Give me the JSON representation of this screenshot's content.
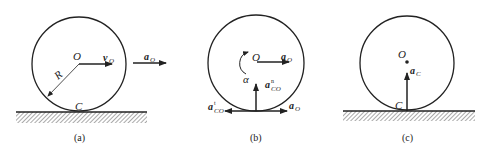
{
  "diagram": {
    "panels": [
      {
        "id": "a",
        "caption": "(a)",
        "center_label": "O",
        "contact_label": "C",
        "radius_label": "R",
        "velocity": {
          "base": "v",
          "sub": "O"
        },
        "acceleration": {
          "base": "a",
          "sub": "O"
        }
      },
      {
        "id": "b",
        "caption": "(b)",
        "center_label": "O",
        "angular_accel_label": "α",
        "center_accel": {
          "base": "a",
          "sub": "O"
        },
        "normal_accel": {
          "base": "a",
          "sub": "CO",
          "sup": "n"
        },
        "tangential_accel": {
          "base": "a",
          "sub": "CO",
          "sup": "t"
        },
        "contact_accel": {
          "base": "a",
          "sub": "O"
        }
      },
      {
        "id": "c",
        "caption": "(c)",
        "center_label": "O",
        "contact_label": "C",
        "contact_accel": {
          "base": "a",
          "sub": "C"
        }
      }
    ],
    "colors": {
      "stroke": "#222222",
      "background": "#ffffff"
    }
  }
}
